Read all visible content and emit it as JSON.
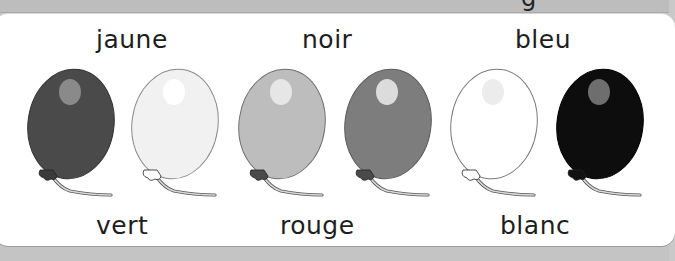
{
  "worksheet": {
    "top_partial_glyph": "g",
    "top_words": [
      "jaune",
      "noir",
      "bleu"
    ],
    "bottom_words": [
      "vert",
      "rouge",
      "blanc"
    ]
  },
  "balloons": [
    {
      "name": "balloon-1",
      "fill": "#4a4a4a",
      "outline": "#333333",
      "highlight": "#8a8a8a",
      "knot": "#3a3a3a"
    },
    {
      "name": "balloon-2",
      "fill": "#f1f1f1",
      "outline": "#8a8a8a",
      "highlight": "#ffffff",
      "knot": "#ffffff"
    },
    {
      "name": "balloon-3",
      "fill": "#bdbdbd",
      "outline": "#6f6f6f",
      "highlight": "#e6e6e6",
      "knot": "#4a4a4a"
    },
    {
      "name": "balloon-4",
      "fill": "#7d7d7d",
      "outline": "#5a5a5a",
      "highlight": "#dcdcdc",
      "knot": "#4a4a4a"
    },
    {
      "name": "balloon-5",
      "fill": "#ffffff",
      "outline": "#7a7a7a",
      "highlight": "#ececec",
      "knot": "#ffffff"
    },
    {
      "name": "balloon-6",
      "fill": "#0d0d0d",
      "outline": "#000000",
      "highlight": "#6e6e6e",
      "knot": "#111111"
    }
  ]
}
